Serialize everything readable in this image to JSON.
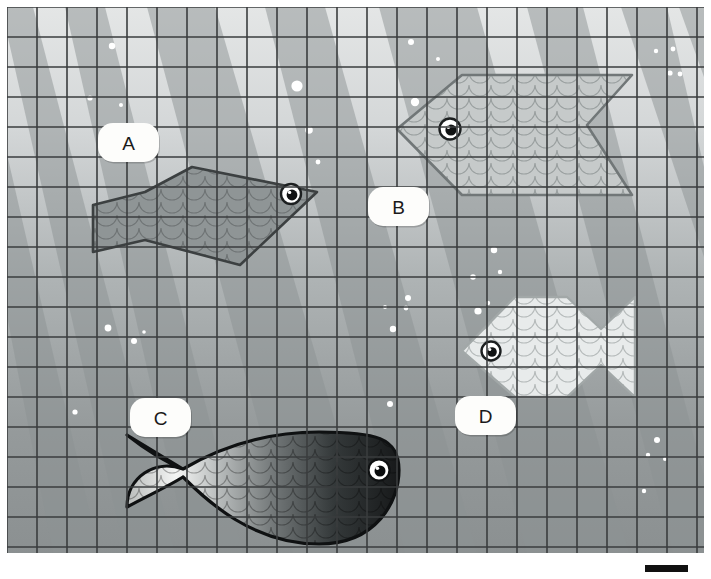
{
  "scene": {
    "title": "Underwater fish scene with grid overlay",
    "canvas": {
      "width": 711,
      "height": 579
    },
    "viewport": {
      "x": 7,
      "y": 7,
      "width": 697,
      "height": 546
    },
    "background": {
      "type": "vertical-gradient",
      "top_color": "#e2e4e4",
      "bottom_color": "#8d9293",
      "description": "water lightening toward the surface"
    },
    "light_rays": {
      "color": "#9aa0a0",
      "opacity": 0.55,
      "direction": "upper-left to lower-right diagonal beams",
      "count": 9
    },
    "grid": {
      "line_color": "#3a3d3e",
      "line_width": 1.6,
      "cell_size": 30,
      "columns": 23,
      "rows": 18,
      "visible": true
    }
  },
  "labels": [
    {
      "id": "A",
      "text": "A",
      "x": 122,
      "y": 136,
      "for_fish": "fish-a"
    },
    {
      "id": "B",
      "text": "B",
      "x": 392,
      "y": 200,
      "for_fish": "fish-b"
    },
    {
      "id": "C",
      "text": "C",
      "x": 154,
      "y": 411,
      "for_fish": "fish-c"
    },
    {
      "id": "D",
      "text": "D",
      "x": 479,
      "y": 409,
      "for_fish": "fish-d"
    }
  ],
  "fishes": [
    {
      "id": "fish-a",
      "label": "A",
      "style": "angular-polygon",
      "facing": "right",
      "body_color": "#8e9495",
      "outline_color": "#3c4041",
      "scales": true,
      "eye": {
        "x": 284,
        "y": 187
      },
      "bounds": {
        "x": 92,
        "y": 160,
        "width": 237,
        "height": 100
      }
    },
    {
      "id": "fish-b",
      "label": "B",
      "style": "angular-polygon",
      "facing": "left",
      "body_color": "#c9cdcd",
      "outline_color": "#6d7374",
      "scales": true,
      "eye": {
        "x": 443,
        "y": 122
      },
      "bounds": {
        "x": 390,
        "y": 68,
        "width": 235,
        "height": 120
      }
    },
    {
      "id": "fish-c",
      "label": "C",
      "style": "organic-rounded",
      "facing": "right",
      "body_gradient": {
        "from": "#f2f3f2",
        "to": "#1c1f20"
      },
      "outline_color": "#111314",
      "scales": true,
      "eye": {
        "x": 372,
        "y": 463
      },
      "bounds": {
        "x": 120,
        "y": 425,
        "width": 272,
        "height": 112
      }
    },
    {
      "id": "fish-d",
      "label": "D",
      "style": "angular-polygon",
      "facing": "left",
      "body_color": "#e9ecec",
      "outline_color": "#9aa0a0",
      "scales": true,
      "eye": {
        "x": 484,
        "y": 344
      },
      "bounds": {
        "x": 455,
        "y": 290,
        "width": 139,
        "height": 100
      }
    }
  ],
  "bubbles": [
    {
      "x": 105,
      "y": 39,
      "r": 3.2
    },
    {
      "x": 83,
      "y": 91,
      "r": 2.6
    },
    {
      "x": 114,
      "y": 98,
      "r": 2.0
    },
    {
      "x": 101,
      "y": 321,
      "r": 3.4
    },
    {
      "x": 127,
      "y": 334,
      "r": 3.0
    },
    {
      "x": 137,
      "y": 325,
      "r": 1.8
    },
    {
      "x": 68,
      "y": 405,
      "r": 2.6
    },
    {
      "x": 290,
      "y": 79,
      "r": 5.6
    },
    {
      "x": 302,
      "y": 123,
      "r": 3.8
    },
    {
      "x": 311,
      "y": 155,
      "r": 2.4
    },
    {
      "x": 404,
      "y": 35,
      "r": 3.0
    },
    {
      "x": 431,
      "y": 52,
      "r": 2.0
    },
    {
      "x": 408,
      "y": 95,
      "r": 4.2
    },
    {
      "x": 466,
      "y": 270,
      "r": 2.8
    },
    {
      "x": 481,
      "y": 296,
      "r": 2.2
    },
    {
      "x": 471,
      "y": 304,
      "r": 3.6
    },
    {
      "x": 487,
      "y": 243,
      "r": 3.2
    },
    {
      "x": 493,
      "y": 265,
      "r": 2.2
    },
    {
      "x": 401,
      "y": 291,
      "r": 3.0
    },
    {
      "x": 386,
      "y": 322,
      "r": 3.2
    },
    {
      "x": 383,
      "y": 397,
      "r": 3.0
    },
    {
      "x": 378,
      "y": 300,
      "r": 2.0
    },
    {
      "x": 399,
      "y": 301,
      "r": 2.4
    },
    {
      "x": 649,
      "y": 44,
      "r": 2.2
    },
    {
      "x": 666,
      "y": 42,
      "r": 2.4
    },
    {
      "x": 663,
      "y": 66,
      "r": 2.6
    },
    {
      "x": 673,
      "y": 67,
      "r": 2.4
    },
    {
      "x": 650,
      "y": 433,
      "r": 3.0
    },
    {
      "x": 641,
      "y": 448,
      "r": 2.2
    },
    {
      "x": 658,
      "y": 452,
      "r": 2.0
    },
    {
      "x": 637,
      "y": 484,
      "r": 2.2
    }
  ],
  "corner_mark": {
    "present": true,
    "color": "#111111",
    "x": 645,
    "y": 565,
    "width": 43,
    "height": 7
  }
}
